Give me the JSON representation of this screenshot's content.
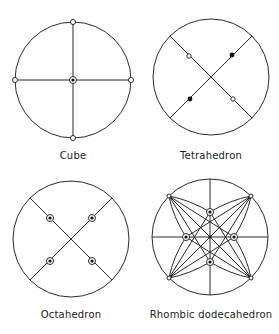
{
  "figure": {
    "panels": [
      {
        "id": "cube",
        "label": "Cube",
        "center": [
          73,
          80
        ],
        "radius": 58,
        "label_pos": [
          73,
          150
        ]
      },
      {
        "id": "tetrahedron",
        "label": "Tetrahedron",
        "center": [
          211,
          77
        ],
        "radius": 58,
        "label_pos": [
          211,
          150
        ]
      },
      {
        "id": "octahedron",
        "label": "Octahedron",
        "center": [
          71,
          239
        ],
        "radius": 58,
        "label_pos": [
          71,
          309
        ]
      },
      {
        "id": "rhombic-dodecahedron",
        "label": "Rhombic dodecahedron",
        "center": [
          210,
          237
        ],
        "radius": 58,
        "label_pos": [
          211,
          309
        ]
      }
    ],
    "colors": {
      "stroke": "#2a2a2a",
      "background": "#ffffff"
    }
  }
}
